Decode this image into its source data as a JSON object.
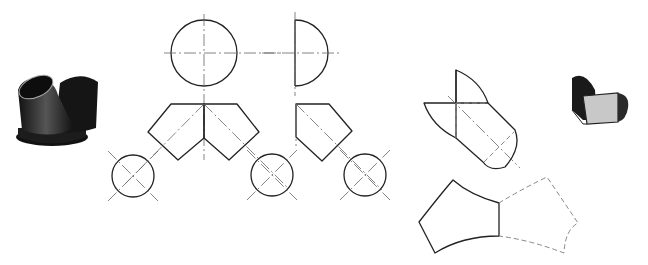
{
  "figure": {
    "colors": {
      "outline": "#222222",
      "centerline": "#666666",
      "hidden": "#888888",
      "solid_dark": "#1a1a1a",
      "solid_gray": "#bdbdbd"
    },
    "parts": [
      {
        "id": "photo-y-branch",
        "label": ""
      },
      {
        "id": "front-view",
        "label": ""
      },
      {
        "id": "side-view",
        "label": ""
      },
      {
        "id": "top-circles",
        "label": ""
      },
      {
        "id": "branch-development",
        "label": ""
      },
      {
        "id": "body-development",
        "label": ""
      },
      {
        "id": "photo-branch-piece",
        "label": ""
      }
    ]
  }
}
